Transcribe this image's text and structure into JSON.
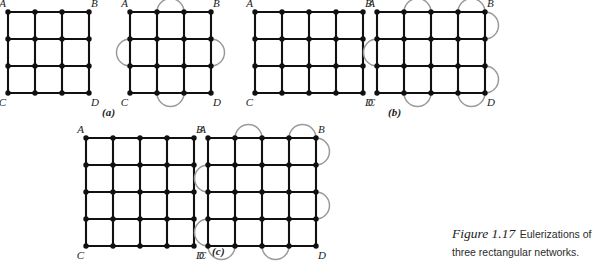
{
  "figure": {
    "caption_title": "Figure 1.17",
    "caption_body": "Eulerizations of three rectangular networks.",
    "corner_labels": {
      "top_left": "A",
      "top_right": "B",
      "bottom_left": "C",
      "bottom_right": "D"
    }
  },
  "panels": [
    {
      "id": "a",
      "label": "(a)",
      "graphs": [
        {
          "name": "original-network-a",
          "cols": 4,
          "rows": 4,
          "arcs": []
        },
        {
          "name": "eulerized-network-a",
          "cols": 4,
          "rows": 4,
          "arcs": [
            {
              "side": "top",
              "from": 1,
              "to": 2
            },
            {
              "side": "bottom",
              "from": 1,
              "to": 2
            },
            {
              "side": "left",
              "from": 1,
              "to": 2
            },
            {
              "side": "right",
              "from": 1,
              "to": 2
            }
          ]
        }
      ]
    },
    {
      "id": "b",
      "label": "(b)",
      "graphs": [
        {
          "name": "original-network-b",
          "cols": 5,
          "rows": 4,
          "arcs": []
        },
        {
          "name": "eulerized-network-b",
          "cols": 5,
          "rows": 4,
          "arcs": [
            {
              "side": "top",
              "from": 1,
              "to": 2
            },
            {
              "side": "top",
              "from": 3,
              "to": 4
            },
            {
              "side": "bottom",
              "from": 1,
              "to": 2
            },
            {
              "side": "bottom",
              "from": 3,
              "to": 4
            },
            {
              "side": "left",
              "from": 1,
              "to": 2
            },
            {
              "side": "right",
              "from": 0,
              "to": 1
            },
            {
              "side": "right",
              "from": 2,
              "to": 3
            }
          ]
        }
      ]
    },
    {
      "id": "c",
      "label": "(c)",
      "graphs": [
        {
          "name": "original-network-c",
          "cols": 5,
          "rows": 5,
          "arcs": []
        },
        {
          "name": "eulerized-network-c",
          "cols": 5,
          "rows": 5,
          "arcs": [
            {
              "side": "top",
              "from": 1,
              "to": 2
            },
            {
              "side": "top",
              "from": 3,
              "to": 4
            },
            {
              "side": "bottom",
              "from": 0,
              "to": 1
            },
            {
              "side": "bottom",
              "from": 2,
              "to": 3
            },
            {
              "side": "left",
              "from": 1,
              "to": 2
            },
            {
              "side": "left",
              "from": 3,
              "to": 4
            },
            {
              "side": "right",
              "from": 0,
              "to": 1
            },
            {
              "side": "right",
              "from": 2,
              "to": 3
            }
          ]
        }
      ]
    }
  ],
  "layout": {
    "panel_positions": [
      {
        "id": "a",
        "left": 8,
        "top": 12,
        "label_left": 102,
        "label_top": 106
      },
      {
        "id": "b",
        "left": 255,
        "top": 12,
        "label_left": 388,
        "label_top": 106
      },
      {
        "id": "c",
        "left": 86,
        "top": 138,
        "label_left": 212,
        "label_top": 245
      }
    ],
    "graph_gap": 122,
    "cell": 27,
    "colors": {
      "edge": "#111111",
      "vertex": "#111111",
      "arc": "#9a9a9a",
      "text": "#1a1a1a",
      "background": "#ffffff"
    }
  }
}
